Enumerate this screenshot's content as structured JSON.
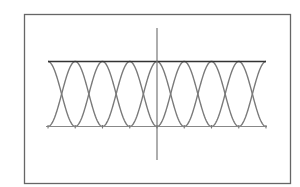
{
  "chart_data": {
    "type": "line",
    "title": "",
    "xlabel": "",
    "ylabel": "",
    "xlim": [
      -12.566,
      12.566
    ],
    "ylim": [
      -1,
      1
    ],
    "grid": false,
    "legend": null,
    "x_ticks": [
      -12.566,
      -9.425,
      -6.283,
      -3.142,
      0,
      3.142,
      6.283,
      9.425,
      12.566
    ],
    "x_tick_labels": [],
    "series": [
      {
        "name": "y = cos(x)",
        "function": "cos",
        "color": "#7a7a7a"
      },
      {
        "name": "y = -cos(x)",
        "function": "negcos",
        "color": "#7a7a7a"
      }
    ],
    "reference_lines": [
      {
        "type": "horizontal",
        "y": 1,
        "color": "#333333",
        "width": 1.6
      },
      {
        "type": "horizontal",
        "y": -1,
        "color": "#888888",
        "width": 1
      }
    ],
    "axes": {
      "vertical_axis_x": 0
    }
  },
  "colors": {
    "frame": "#666666",
    "axis": "#777777",
    "curve": "#7a7a7a",
    "top_line": "#333333",
    "bottom_line": "#888888",
    "background": "#ffffff"
  }
}
